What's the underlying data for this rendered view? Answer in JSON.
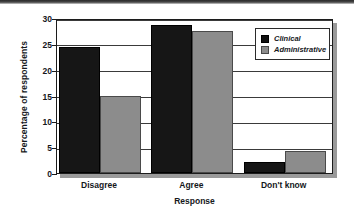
{
  "chart_data": {
    "type": "bar",
    "title": "",
    "xlabel": "Response",
    "ylabel": "Percentage of respondents",
    "categories": [
      "Disagree",
      "Agree",
      "Don't know"
    ],
    "series": [
      {
        "name": "Clinical",
        "color": "#161616",
        "values": [
          24.3,
          28.6,
          2.2
        ]
      },
      {
        "name": "Administrative",
        "color": "#8c8c8c",
        "values": [
          15.0,
          27.5,
          4.3
        ]
      }
    ],
    "ylim": [
      0,
      30
    ],
    "yticks": [
      0,
      5,
      10,
      15,
      20,
      25,
      30
    ],
    "ytick_labels": [
      "0",
      "5",
      "10",
      "15",
      "20",
      "25",
      "30"
    ],
    "grid": true,
    "grid_axis": "y",
    "legend_position": "top-right",
    "bar_group_gap": true
  },
  "legend": {
    "entries": [
      {
        "label": "Clinical",
        "swatch": "black-square-swatch"
      },
      {
        "label": "Administrative",
        "swatch": "gray-square-swatch"
      }
    ]
  }
}
